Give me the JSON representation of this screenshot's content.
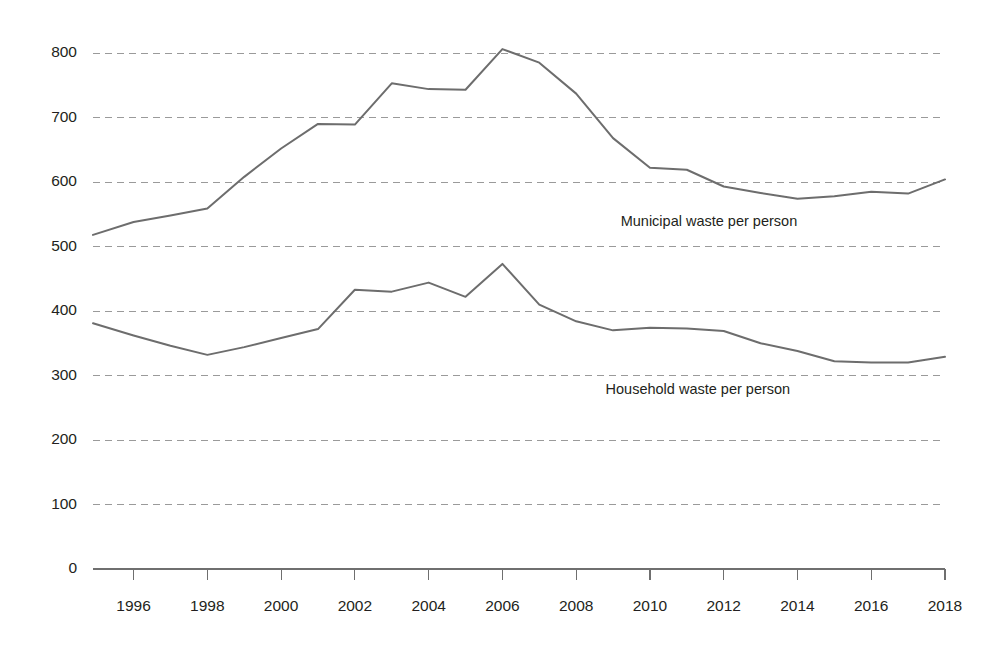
{
  "chart_data": {
    "type": "line",
    "title": "",
    "subtitle": "",
    "xlabel": "",
    "ylabel": "",
    "xlim": [
      1994.9,
      2018
    ],
    "ylim": [
      0,
      830
    ],
    "grid": true,
    "grid_axis": "y",
    "legend_position": "inline-labels",
    "x_tick_labels": [
      "1996",
      "1998",
      "2000",
      "2002",
      "2004",
      "2006",
      "2008",
      "2010",
      "2012",
      "2014",
      "2016",
      "2018"
    ],
    "x_ticks": [
      1996,
      1998,
      2000,
      2002,
      2004,
      2006,
      2008,
      2010,
      2012,
      2014,
      2016,
      2018
    ],
    "y_tick_labels": [
      "0",
      "100",
      "200",
      "300",
      "400",
      "500",
      "600",
      "700",
      "800"
    ],
    "y_ticks": [
      0,
      100,
      200,
      300,
      400,
      500,
      600,
      700,
      800
    ],
    "x": [
      1994.9,
      1996,
      1997,
      1998,
      1999,
      2000,
      2001,
      2002,
      2003,
      2004,
      2005,
      2006,
      2007,
      2008,
      2009,
      2010,
      2011,
      2012,
      2013,
      2014,
      2015,
      2016,
      2017,
      2018
    ],
    "series": [
      {
        "name": "Municipal waste per person",
        "color": "#6d6d6d",
        "label_x": 2011.6,
        "label_y": 538,
        "values": [
          518,
          538,
          548,
          559,
          608,
          652,
          690,
          689,
          753,
          744,
          743,
          806,
          785,
          737,
          668,
          622,
          619,
          593,
          583,
          574,
          578,
          585,
          582,
          604
        ]
      },
      {
        "name": "Household waste per person",
        "color": "#6d6d6d",
        "label_x": 2011.3,
        "label_y": 278,
        "values": [
          381,
          362,
          346,
          332,
          344,
          358,
          372,
          433,
          430,
          444,
          422,
          473,
          410,
          384,
          370,
          374,
          373,
          369,
          350,
          338,
          322,
          320,
          320,
          329
        ]
      }
    ]
  },
  "geometry": {
    "plot_left": 93,
    "plot_right": 945,
    "x_axis_y": 569,
    "y_value_top": 800,
    "y_top_px": 53,
    "y_zero_px": 569
  }
}
